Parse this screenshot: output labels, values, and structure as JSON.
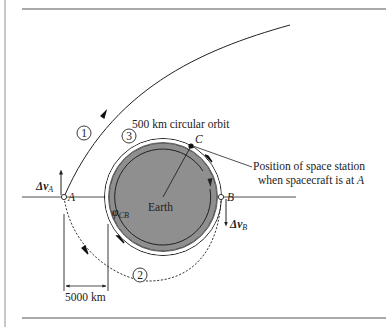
{
  "figure": {
    "orbit_label": "500 km circular orbit",
    "earth_label": "Earth",
    "station_annotation": {
      "line1": "Position of space station",
      "line2_prefix": "when spacecraft is at ",
      "line2_point": "A"
    },
    "points": {
      "A": "A",
      "B": "B",
      "C": "C"
    },
    "trajectory_labels": {
      "t1": "1",
      "t2": "2",
      "t3": "3"
    },
    "delta_v_A": {
      "symbol": "Δv",
      "subscript": "A"
    },
    "delta_v_B": {
      "symbol": "Δv",
      "subscript": "B"
    },
    "phase_angle": {
      "symbol": "φ",
      "subscript": "CB"
    },
    "distance_label": "5000 km"
  },
  "colors": {
    "earth_fill": "#8f8f8f",
    "line": "#222222",
    "page_border": "#c8c8c8",
    "rule": "#555555"
  }
}
